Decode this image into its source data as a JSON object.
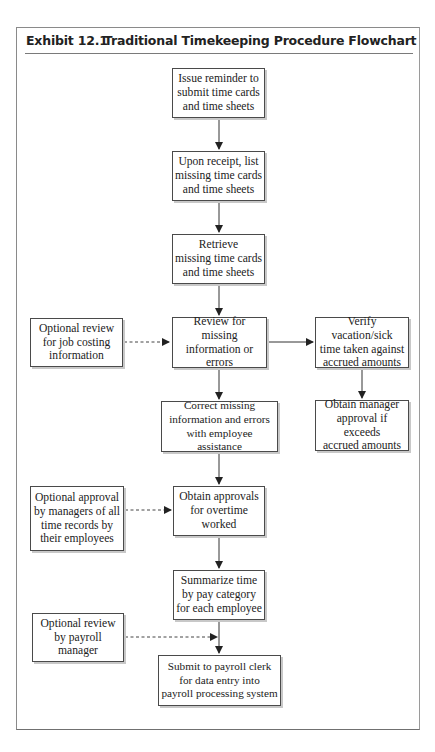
{
  "exhibit": {
    "number": "Exhibit 12.1",
    "title": "Traditional Timekeeping Procedure Flowchart"
  },
  "flowchart": {
    "main_steps": [
      {
        "id": "issue-reminder",
        "label": "Issue reminder to\nsubmit time cards\nand time sheets"
      },
      {
        "id": "list-missing",
        "label": "Upon receipt, list\nmissing time cards\nand time sheets"
      },
      {
        "id": "retrieve-missing",
        "label": "Retrieve\nmissing time cards\nand time sheets"
      },
      {
        "id": "review-missing",
        "label": "Review for missing\ninformation or\nerrors"
      },
      {
        "id": "correct-missing",
        "label": "Correct missing\ninformation and errors\nwith employee assistance"
      },
      {
        "id": "obtain-approvals",
        "label": "Obtain approvals\nfor overtime\nworked"
      },
      {
        "id": "summarize-time",
        "label": "Summarize time\nby pay category\nfor each employee"
      },
      {
        "id": "submit-payroll",
        "label": "Submit to payroll clerk\nfor data entry into\npayroll processing system"
      }
    ],
    "side_steps": [
      {
        "id": "verify-vacation",
        "label": "Verify vacation/sick\ntime taken against\naccrued amounts"
      },
      {
        "id": "manager-approval",
        "label": "Obtain manager\napproval if exceeds\naccrued amounts"
      }
    ],
    "optional_steps": [
      {
        "id": "optional-job-costing",
        "label": "Optional review\nfor job costing\ninformation"
      },
      {
        "id": "optional-manager-approval",
        "label": "Optional approval\nby managers of all\ntime records by\ntheir employees"
      },
      {
        "id": "optional-payroll-review",
        "label": "Optional review\nby payroll\nmanager"
      }
    ],
    "connections": [
      {
        "from": "issue-reminder",
        "to": "list-missing",
        "style": "solid"
      },
      {
        "from": "list-missing",
        "to": "retrieve-missing",
        "style": "solid"
      },
      {
        "from": "retrieve-missing",
        "to": "review-missing",
        "style": "solid"
      },
      {
        "from": "review-missing",
        "to": "verify-vacation",
        "style": "solid"
      },
      {
        "from": "verify-vacation",
        "to": "manager-approval",
        "style": "solid"
      },
      {
        "from": "review-missing",
        "to": "correct-missing",
        "style": "solid"
      },
      {
        "from": "correct-missing",
        "to": "obtain-approvals",
        "style": "solid"
      },
      {
        "from": "obtain-approvals",
        "to": "summarize-time",
        "style": "solid"
      },
      {
        "from": "summarize-time",
        "to": "submit-payroll",
        "style": "solid"
      },
      {
        "from": "optional-job-costing",
        "to": "review-missing",
        "style": "dashed"
      },
      {
        "from": "optional-manager-approval",
        "to": "obtain-approvals",
        "style": "dashed"
      },
      {
        "from": "optional-payroll-review",
        "to": "summarize-submit-connector",
        "style": "dashed"
      }
    ]
  }
}
